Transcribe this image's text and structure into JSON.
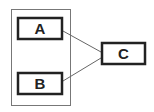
{
  "diagram": {
    "container": {
      "x": 11,
      "y": 9,
      "w": 59,
      "h": 96,
      "stroke": "#777777"
    },
    "nodes": [
      {
        "id": "A",
        "label": "A",
        "x": 17,
        "y": 17,
        "w": 46,
        "h": 23
      },
      {
        "id": "B",
        "label": "B",
        "x": 17,
        "y": 72,
        "w": 46,
        "h": 23
      },
      {
        "id": "C",
        "label": "C",
        "x": 101,
        "y": 42,
        "w": 45,
        "h": 23
      }
    ],
    "edges": [
      {
        "from": "A",
        "to": "C"
      },
      {
        "from": "B",
        "to": "C"
      }
    ],
    "colors": {
      "node_stroke": "#222222",
      "edge": "#666666",
      "background": "#ffffff"
    }
  }
}
